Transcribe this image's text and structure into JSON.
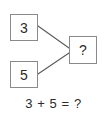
{
  "diagram": {
    "type": "addition-number-bond",
    "background_color": "#ffffff",
    "border_color": "#8a8a8a",
    "text_color": "#2b2b2b",
    "nodes": [
      {
        "id": "addend-one",
        "label": "3",
        "role": "addend",
        "x": 10,
        "y": 14,
        "width": 28,
        "height": 27
      },
      {
        "id": "addend-two",
        "label": "5",
        "role": "addend",
        "x": 10,
        "y": 61,
        "width": 28,
        "height": 27
      },
      {
        "id": "sum",
        "label": "?",
        "role": "result",
        "x": 69,
        "y": 36,
        "width": 28,
        "height": 28
      }
    ],
    "connectors": [
      {
        "id": "addend-one-to-sum",
        "from": "addend-one",
        "to": "sum",
        "x1": 38,
        "y1": 26,
        "x2": 69,
        "y2": 48
      },
      {
        "id": "addend-two-to-sum",
        "from": "addend-two",
        "to": "sum",
        "x1": 38,
        "y1": 74,
        "x2": 69,
        "y2": 53
      }
    ]
  },
  "equation": {
    "text": "3 + 5 = ?",
    "left_operand": "3",
    "operator": "+",
    "right_operand": "5",
    "equals": "=",
    "result": "?"
  }
}
